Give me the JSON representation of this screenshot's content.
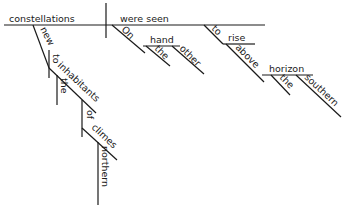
{
  "diagram": {
    "type": "sentence-diagram",
    "subject": "constellations",
    "verb": "were seen",
    "subject_modifiers": {
      "adjective": "new",
      "prep": "to",
      "prep_object": "inhabitants",
      "object_article": "the",
      "nested_prep": "of",
      "nested_object": "climes",
      "nested_adjective": "northern"
    },
    "verb_modifiers": {
      "phrase_prep": "On",
      "phrase_object": "hand",
      "phrase_article": "the",
      "phrase_adjective": "other"
    },
    "infinitive": {
      "marker": "to",
      "verb": "rise",
      "prep": "above",
      "object": "horizon",
      "article": "the",
      "adjective": "southern"
    }
  }
}
